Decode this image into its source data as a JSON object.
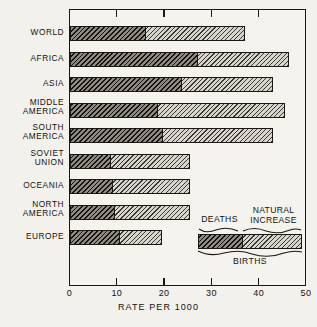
{
  "chart_data": {
    "type": "bar",
    "orientation": "horizontal",
    "stacked": true,
    "title": "",
    "xlabel": "RATE PER 1000",
    "ylabel": "",
    "xlim": [
      0,
      50
    ],
    "xticks": [
      0,
      10,
      20,
      30,
      40,
      50
    ],
    "xticklabels": [
      "0",
      "10",
      "20",
      "30",
      "40",
      "50"
    ],
    "grid": false,
    "legend_position": "inside-lower-right",
    "categories": [
      "WORLD",
      "AFRICA",
      "ASIA",
      "MIDDLE AMERICA",
      "SOUTH AMERICA",
      "SOVIET UNION",
      "OCEANIA",
      "NORTH AMERICA",
      "EUROPE"
    ],
    "series": [
      {
        "name": "DEATHS",
        "values": [
          16,
          27,
          23.5,
          18.5,
          19.5,
          8.5,
          9,
          9.5,
          10.5
        ]
      },
      {
        "name": "NATURAL INCREASE",
        "values": [
          21,
          19.5,
          19.5,
          27,
          23.5,
          17,
          16.5,
          16,
          9
        ]
      }
    ],
    "totals_label": "BIRTHS",
    "totals": [
      37,
      46.5,
      43,
      45.5,
      43,
      25.5,
      25.5,
      25.5,
      19.5
    ]
  },
  "rows": [
    {
      "line1": "WORLD",
      "line2": "",
      "deaths": 16,
      "total": 37
    },
    {
      "line1": "AFRICA",
      "line2": "",
      "deaths": 27,
      "total": 46.5
    },
    {
      "line1": "ASIA",
      "line2": "",
      "deaths": 23.5,
      "total": 43
    },
    {
      "line1": "MIDDLE",
      "line2": "AMERICA",
      "deaths": 18.5,
      "total": 45.5
    },
    {
      "line1": "SOUTH",
      "line2": "AMERICA",
      "deaths": 19.5,
      "total": 43
    },
    {
      "line1": "SOVIET",
      "line2": "UNION",
      "deaths": 8.5,
      "total": 25.5
    },
    {
      "line1": "OCEANIA",
      "line2": "",
      "deaths": 9,
      "total": 25.5
    },
    {
      "line1": "NORTH",
      "line2": "AMERICA",
      "deaths": 9.5,
      "total": 25.5
    },
    {
      "line1": "EUROPE",
      "line2": "",
      "deaths": 10.5,
      "total": 19.5
    }
  ],
  "axis": {
    "title": "RATE PER 1000",
    "ticklabels": [
      "0",
      "10",
      "20",
      "30",
      "40",
      "50"
    ]
  },
  "legend": {
    "deaths_label": "DEATHS",
    "increase_label_line1": "NATURAL",
    "increase_label_line2": "INCREASE",
    "births_label": "BIRTHS"
  },
  "colors": {
    "ink": "#1a1714",
    "paper": "#f2f1ec",
    "deaths_fill": "#8f8b82",
    "increase_fill": "#d8d5cd"
  }
}
